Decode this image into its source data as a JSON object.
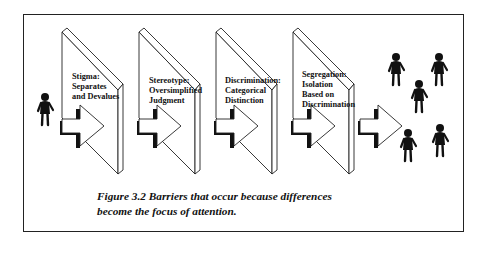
{
  "figure": {
    "stages": [
      {
        "label": "Stigma:\nSeparates\nand Devalues"
      },
      {
        "label": "Stereotype:\nOversimplified\nJudgment"
      },
      {
        "label": "Discrimination:\nCategorical\nDistinction"
      },
      {
        "label": "Segregation:\nIsolation\nBased on\nDiscrimination"
      }
    ],
    "caption": "Figure 3.2 Barriers that occur because differences\nbecome the focus of attention.",
    "icons": [
      "person-icon",
      "arrow-icon",
      "wall-panel-icon",
      "group-of-people-icon"
    ]
  }
}
